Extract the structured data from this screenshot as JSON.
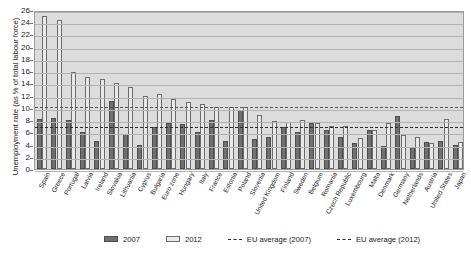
{
  "chart_data": {
    "type": "bar",
    "title": "",
    "xlabel": "",
    "ylabel": "Unemployment rate (as % of total labour force)",
    "ylim": [
      0,
      26
    ],
    "ytick_step": 2,
    "yticks": [
      0,
      2,
      4,
      6,
      8,
      10,
      12,
      14,
      16,
      18,
      20,
      22,
      24,
      26
    ],
    "grid": true,
    "legend_position": "bottom",
    "categories": [
      "Spain",
      "Greece",
      "Portugal",
      "Latvia",
      "Ireland",
      "Slovakia",
      "Lithuania",
      "Cyprus",
      "Bulgaria",
      "Euro zone",
      "Hungary",
      "Italy",
      "France",
      "Estonia",
      "Poland",
      "Slovenia",
      "United Kingdom",
      "Finland",
      "Sweden",
      "Belgium",
      "Romania",
      "Czech Republic",
      "Luxembourg",
      "Malta",
      "Denmark",
      "Germany",
      "Netherlands",
      "Austria",
      "United States",
      "Japan"
    ],
    "series": [
      {
        "name": "2007",
        "color": "#707070",
        "values": [
          8.2,
          8.3,
          8.0,
          6.0,
          4.6,
          11.2,
          5.8,
          3.9,
          6.9,
          7.5,
          7.4,
          6.1,
          8.0,
          4.6,
          9.6,
          4.9,
          5.3,
          6.9,
          6.1,
          7.5,
          6.4,
          5.3,
          4.2,
          6.4,
          3.8,
          8.7,
          3.6,
          4.4,
          4.6,
          3.9
        ]
      },
      {
        "name": "2012",
        "color": "#e9e9e9",
        "values": [
          25.0,
          24.3,
          15.9,
          15.0,
          14.7,
          14.0,
          13.4,
          11.9,
          12.3,
          11.4,
          10.9,
          10.7,
          10.2,
          10.2,
          10.1,
          8.9,
          7.9,
          7.7,
          8.0,
          7.6,
          7.0,
          7.0,
          5.1,
          6.4,
          7.5,
          5.5,
          5.3,
          4.3,
          8.1,
          4.4
        ]
      }
    ],
    "reference_lines": [
      {
        "name": "EU average (2007)",
        "value": 7.2,
        "style": "dashed",
        "color": "#2b2b2b"
      },
      {
        "name": "EU average (2012)",
        "value": 10.5,
        "style": "dashed",
        "color": "#555555"
      }
    ]
  },
  "legend": {
    "items": [
      {
        "label": "2007",
        "marker": "dark-swatch"
      },
      {
        "label": "2012",
        "marker": "light-swatch"
      },
      {
        "label": "EU average (2007)",
        "marker": "dashed-line"
      },
      {
        "label": "EU average (2012)",
        "marker": "dashed-line"
      }
    ]
  }
}
